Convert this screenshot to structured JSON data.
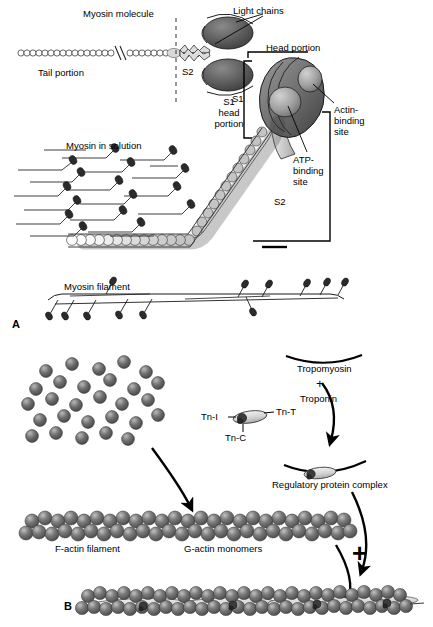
{
  "figure": {
    "width": 433,
    "height": 627,
    "background": "#ffffff",
    "ink": "#000000"
  },
  "panels": [
    {
      "id": "A",
      "label": "A",
      "x": 12,
      "y": 318,
      "topic": "Myosin thick filament assembly"
    },
    {
      "id": "B",
      "label": "B",
      "x": 64,
      "y": 600,
      "topic": "Actin thin filament assembly"
    }
  ],
  "panel_a": {
    "molecule_labels": {
      "myosin_molecule": "Myosin molecule",
      "light_chains": "Light chains",
      "tail_portion": "Tail portion",
      "s2_tail": "S2",
      "s1_head_portion": "S1\nhead\nportion",
      "head_portion": "Head portion",
      "s1_bracket": "S1",
      "actin_binding_site": "Actin-\nbinding\nsite",
      "atp_binding_site": "ATP-\nbinding\nsite",
      "s2_bracket": "S2",
      "myosin_in_solution": "Myosin in solution",
      "myosin_filament": "Myosin filament"
    },
    "colors": {
      "head_dark": "#4a4a4a",
      "head_mid": "#6f6f6f",
      "head_light": "#b8b8b8",
      "tail_fill": "#c9c9c9",
      "outline": "#1a1a1a"
    },
    "solution_molecule_count": 16,
    "filament_head_count": 13
  },
  "panel_b": {
    "labels": {
      "tropomyosin": "Tropomyosin",
      "plus_top": "+",
      "troponin": "Troponin",
      "tn_i": "Tn-I",
      "tn_t": "Tn-T",
      "tn_c": "Tn-C",
      "regulatory_protein_complex": "Regulatory protein complex",
      "f_actin_filament": "F-actin filament",
      "g_actin_monomers": "G-actin monomers",
      "plus_bottom": "+"
    },
    "colors": {
      "actin_sphere": "#5e5e5e",
      "actin_sphere_light": "#9a9a9a",
      "actin_highlight": "#cfcfcf",
      "tropomyosin_fill": "#d8d8d8",
      "troponin_dark": "#3b3b3b"
    },
    "monomer_pool_count": 28,
    "f_actin_sphere_pairs": 30,
    "thin_filament_troponin_count": 4
  }
}
